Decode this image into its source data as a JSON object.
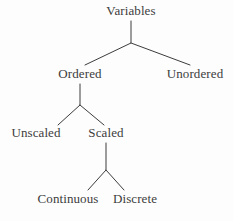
{
  "diagram": {
    "type": "tree",
    "background_color": "#fdfdfd",
    "stroke_color": "#3c3c3c",
    "text_color": "#3c3c3c",
    "nodes": [
      {
        "id": "variables",
        "label": "Variables",
        "x": 131,
        "y": 12,
        "level": 0
      },
      {
        "id": "ordered",
        "label": "Ordered",
        "x": 80,
        "y": 75,
        "level": 1
      },
      {
        "id": "unordered",
        "label": "Unordered",
        "x": 195,
        "y": 75,
        "level": 1
      },
      {
        "id": "unscaled",
        "label": "Unscaled",
        "x": 36,
        "y": 134,
        "level": 2
      },
      {
        "id": "scaled",
        "label": "Scaled",
        "x": 106,
        "y": 134,
        "level": 2
      },
      {
        "id": "continuous",
        "label": "Continuous",
        "x": 68,
        "y": 200,
        "level": 3
      },
      {
        "id": "discrete",
        "label": "Discrete",
        "x": 135,
        "y": 200,
        "level": 3
      }
    ],
    "edges": [
      {
        "from": "variables",
        "to": "ordered",
        "points": "131,21 131,43 85,65"
      },
      {
        "from": "variables",
        "to": "unordered",
        "points": "131,43 190,65"
      },
      {
        "from": "ordered",
        "to": "unscaled",
        "points": "80,84 80,105 58,125"
      },
      {
        "from": "ordered",
        "to": "scaled",
        "points": "80,105 104,125"
      },
      {
        "from": "scaled",
        "to": "continuous",
        "points": "106,143 106,170 88,190"
      },
      {
        "from": "scaled",
        "to": "discrete",
        "points": "106,170 124,190"
      }
    ]
  }
}
